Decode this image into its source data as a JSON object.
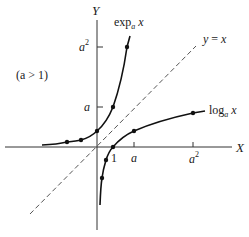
{
  "diagram": {
    "condition_label": "(a > 1)",
    "axes": {
      "x_label": "X",
      "y_label": "Y",
      "x_ticks": [
        "1",
        "a",
        "a",
        "2"
      ],
      "y_ticks": [
        "a",
        "a",
        "2"
      ]
    },
    "x_tick_labels": {
      "one": "1",
      "a": "a",
      "a2_base": "a",
      "a2_exp": "2"
    },
    "y_tick_labels": {
      "a": "a",
      "a2_base": "a",
      "a2_exp": "2"
    },
    "curves": {
      "exp": {
        "name": "exp",
        "sub": "a",
        "var": "x"
      },
      "log": {
        "name": "log",
        "sub": "a",
        "var": "x"
      },
      "identity": {
        "label_lhs": "y",
        "label_eq": "=",
        "label_rhs": "x"
      }
    },
    "colors": {
      "curve": "#111111",
      "axis": "#333333",
      "dashed": "#555555",
      "background": "#ffffff"
    }
  }
}
